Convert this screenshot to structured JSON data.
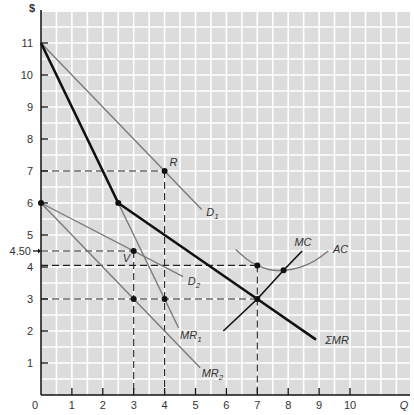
{
  "chart_data": {
    "type": "line",
    "title": "",
    "xlabel": "Q",
    "ylabel": "$",
    "xlim": [
      0,
      11.2
    ],
    "ylim": [
      0,
      12
    ],
    "grid": true,
    "grid_step": 0.5,
    "x_ticks": [
      0,
      1,
      2,
      3,
      4,
      5,
      6,
      7,
      8,
      9,
      10
    ],
    "y_ticks": [
      1,
      2,
      3,
      4,
      5,
      6,
      7,
      8,
      9,
      10,
      11
    ],
    "extra_y_ticks": [
      {
        "value": 4.5,
        "label": "4.50"
      }
    ],
    "colors": {
      "background": "#dcdcdc",
      "grid": "#ffffff",
      "thin_curve": "#7a7a7a",
      "thick_curve": "#111111",
      "dashed": "#222222"
    },
    "series": [
      {
        "name": "D1",
        "label": "D",
        "sub": "1",
        "style": "thin",
        "points": [
          [
            0,
            11
          ],
          [
            5.2,
            5.8
          ]
        ],
        "label_pos": [
          5.35,
          5.6
        ]
      },
      {
        "name": "D2",
        "label": "D",
        "sub": "2",
        "style": "thin",
        "points": [
          [
            0,
            6
          ],
          [
            4.6,
            3.7
          ]
        ],
        "label_pos": [
          4.75,
          3.45
        ]
      },
      {
        "name": "MR1",
        "label": "MR",
        "sub": "1",
        "style": "thin",
        "points": [
          [
            2.5,
            6
          ],
          [
            4.45,
            2.1
          ]
        ],
        "label_pos": [
          4.5,
          1.75
        ]
      },
      {
        "name": "MR2",
        "label": "MR",
        "sub": "2",
        "style": "thin",
        "points": [
          [
            0,
            6
          ],
          [
            5.15,
            0.85
          ]
        ],
        "label_pos": [
          5.2,
          0.55
        ]
      },
      {
        "name": "ΣMR",
        "label": "ΣMR",
        "sub": "",
        "style": "thick",
        "points": [
          [
            0,
            11
          ],
          [
            2.5,
            6
          ],
          [
            4,
            5
          ],
          [
            7,
            3
          ],
          [
            8.9,
            1.73
          ]
        ],
        "label_pos": [
          9.2,
          1.6
        ]
      },
      {
        "name": "MC",
        "label": "MC",
        "sub": "",
        "style": "thick",
        "points": [
          [
            5.9,
            2.0
          ],
          [
            7,
            3
          ],
          [
            7.85,
            3.9
          ],
          [
            8.45,
            4.5
          ]
        ],
        "label_pos": [
          8.2,
          4.65
        ]
      },
      {
        "name": "AC",
        "label": "AC",
        "sub": "",
        "style": "thin",
        "points": [
          [
            6.3,
            4.55
          ],
          [
            6.7,
            4.2
          ],
          [
            7,
            4.05
          ],
          [
            7.4,
            3.9
          ],
          [
            7.85,
            3.88
          ],
          [
            8.4,
            3.98
          ],
          [
            8.9,
            4.2
          ],
          [
            9.3,
            4.5
          ]
        ],
        "label_pos": [
          9.45,
          4.45
        ]
      }
    ],
    "points": [
      {
        "name": "R",
        "x": 4,
        "y": 7,
        "label": "R",
        "label_offset": [
          5,
          -5
        ]
      },
      {
        "name": "V",
        "x": 3,
        "y": 4.5,
        "label": "V",
        "label_offset": [
          -11,
          11
        ]
      },
      {
        "name": "kink",
        "x": 2.5,
        "y": 6,
        "label": ""
      },
      {
        "name": "origin-6",
        "x": 0,
        "y": 6,
        "label": ""
      },
      {
        "name": "MR2-3",
        "x": 3,
        "y": 3,
        "label": ""
      },
      {
        "name": "MR1-3",
        "x": 4,
        "y": 3,
        "label": ""
      },
      {
        "name": "AC-7",
        "x": 7,
        "y": 4.05,
        "label": ""
      },
      {
        "name": "AC-MC",
        "x": 7.85,
        "y": 3.9,
        "label": ""
      },
      {
        "name": "MC-SMR",
        "x": 7,
        "y": 3,
        "label": ""
      }
    ],
    "dashed_lines": [
      {
        "from": [
          0,
          7
        ],
        "to": [
          4,
          7
        ]
      },
      {
        "from": [
          4,
          7
        ],
        "to": [
          4,
          0
        ]
      },
      {
        "from": [
          0,
          4.5
        ],
        "to": [
          3,
          4.5
        ]
      },
      {
        "from": [
          3,
          4.5
        ],
        "to": [
          3,
          0
        ]
      },
      {
        "from": [
          0,
          4.05
        ],
        "to": [
          7,
          4.05
        ]
      },
      {
        "from": [
          7,
          4.05
        ],
        "to": [
          7,
          0
        ]
      },
      {
        "from": [
          0,
          3
        ],
        "to": [
          7,
          3
        ]
      }
    ]
  }
}
